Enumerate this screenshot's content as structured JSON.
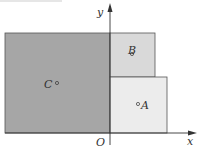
{
  "figure": {
    "axes": {
      "x_label": "x",
      "y_label": "y",
      "origin_label": "O"
    },
    "regions": [
      {
        "name": "C",
        "label": "C",
        "fill": "#a6a6a6"
      },
      {
        "name": "B",
        "label": "B",
        "fill": "#d9d9d9"
      },
      {
        "name": "A",
        "label": "A",
        "fill": "#ececec"
      }
    ],
    "colors": {
      "stroke": "#555555",
      "axis": "#333333"
    }
  }
}
